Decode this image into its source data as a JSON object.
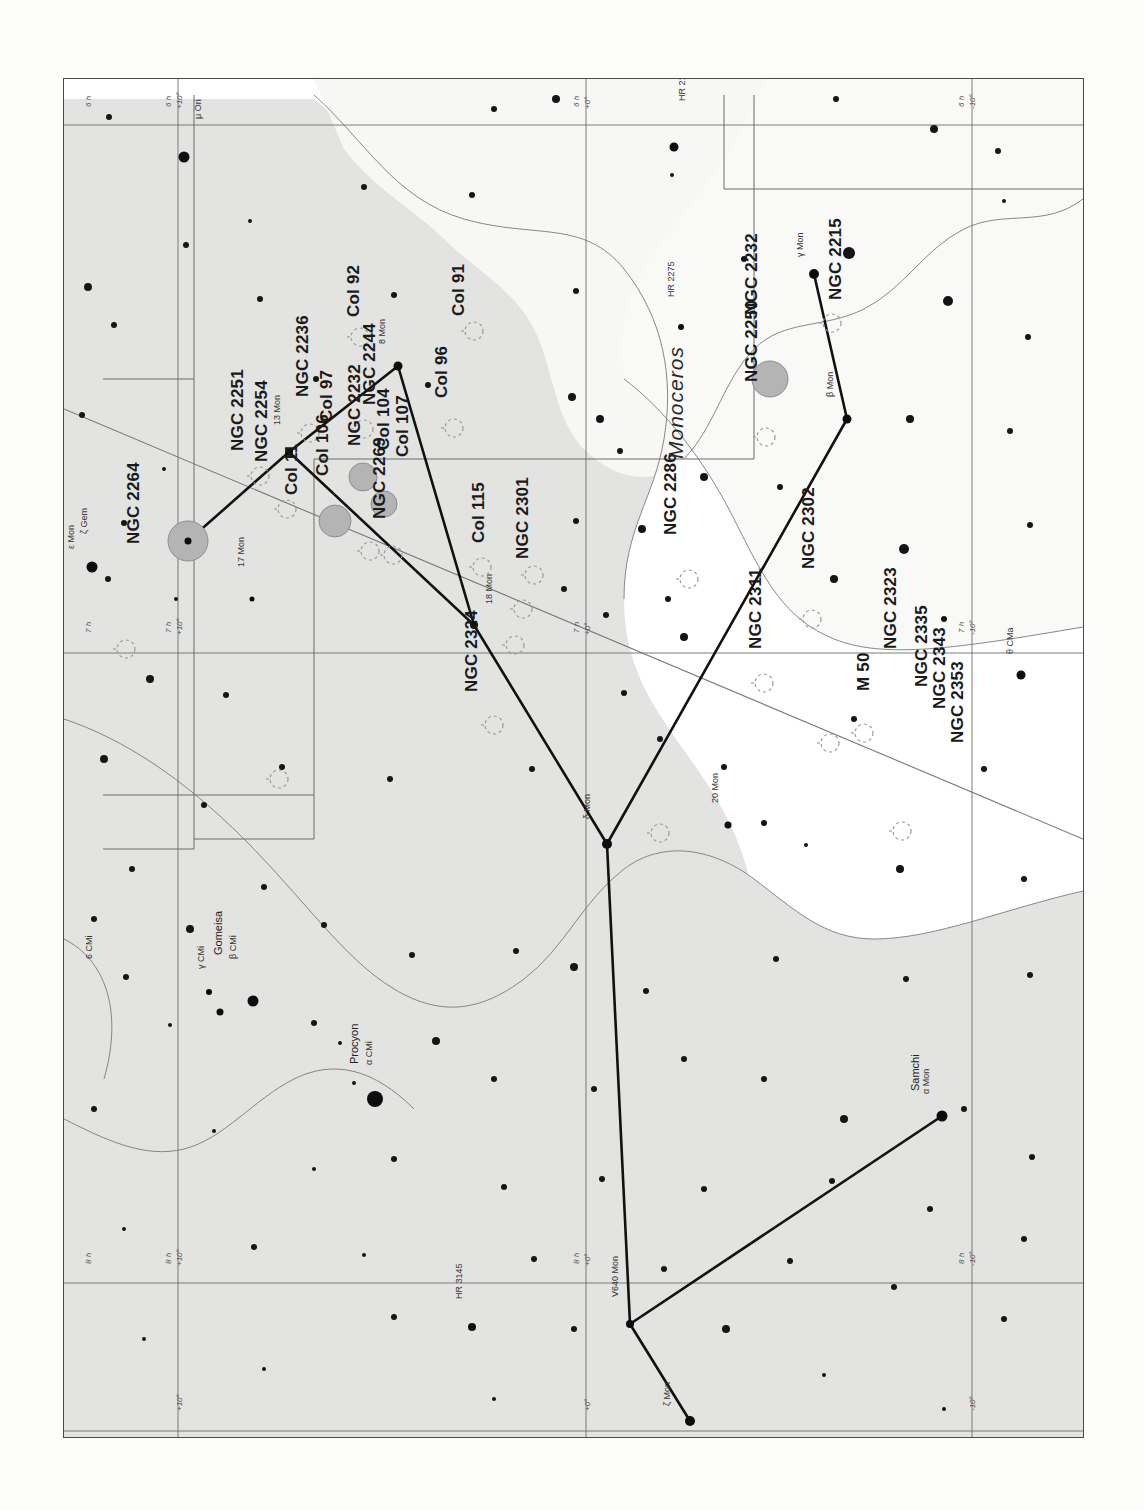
{
  "meta": {
    "chart_type": "star-chart",
    "constellation": "Monoceros",
    "orientation_note": "chart rotated 90° counter-clockwise on the page",
    "ink_color": "#1a1a1a",
    "milkyway_fill": "#e3e3e1",
    "frame_color": "#4a4a4a"
  },
  "constellation_label": "Monoceros",
  "deep_sky_objects": [
    {
      "label": "NGC 2264",
      "x": 60,
      "y": 465
    },
    {
      "label": "NGC 2251",
      "x": 164,
      "y": 372
    },
    {
      "label": "NGC 2254",
      "x": 188,
      "y": 383
    },
    {
      "label": "NGC 2236",
      "x": 229,
      "y": 318
    },
    {
      "label": "Col 11",
      "x": 218,
      "y": 416
    },
    {
      "label": "Col 106",
      "x": 249,
      "y": 397
    },
    {
      "label": "Col 97",
      "x": 253,
      "y": 343
    },
    {
      "label": "NGC 2232",
      "x": 281,
      "y": 367
    },
    {
      "label": "NGC 2244",
      "x": 296,
      "y": 326
    },
    {
      "label": "Col 104",
      "x": 310,
      "y": 371
    },
    {
      "label": "Col 107",
      "x": 329,
      "y": 378
    },
    {
      "label": "NGC 2269",
      "x": 306,
      "y": 440
    },
    {
      "label": "Col 92",
      "x": 280,
      "y": 238
    },
    {
      "label": "Col 91",
      "x": 385,
      "y": 237
    },
    {
      "label": "Col 96",
      "x": 368,
      "y": 319
    },
    {
      "label": "Col 115",
      "x": 405,
      "y": 464
    },
    {
      "label": "NGC 2301",
      "x": 449,
      "y": 480
    },
    {
      "label": "NGC 2324",
      "x": 398,
      "y": 613
    },
    {
      "label": "NGC 2215",
      "x": 762,
      "y": 221
    },
    {
      "label": "NGC 2232 ",
      "x": 678,
      "y": 236
    },
    {
      "label": "NGC 2250",
      "x": 678,
      "y": 303
    },
    {
      "label": "NGC 2286",
      "x": 597,
      "y": 456
    },
    {
      "label": "NGC 2302",
      "x": 735,
      "y": 490
    },
    {
      "label": "NGC 2311",
      "x": 682,
      "y": 570
    },
    {
      "label": "NGC 2323",
      "x": 817,
      "y": 570
    },
    {
      "label": "M 50",
      "x": 790,
      "y": 612
    },
    {
      "label": "NGC 2335",
      "x": 848,
      "y": 608
    },
    {
      "label": "NGC 2343",
      "x": 866,
      "y": 630
    },
    {
      "label": "NGC 2353",
      "x": 884,
      "y": 664
    }
  ],
  "star_labels": [
    {
      "label": "μ Ori",
      "x": 129,
      "y": 40
    },
    {
      "label": "ζ Gem",
      "x": 15,
      "y": 455
    },
    {
      "label": "6 CMi",
      "x": 20,
      "y": 880
    },
    {
      "label": "θ CMa",
      "x": 941,
      "y": 575
    },
    {
      "label": "HR 2113",
      "x": 613,
      "y": 22
    },
    {
      "label": "HR 2275",
      "x": 602,
      "y": 218
    },
    {
      "label": "HR 3145",
      "x": 390,
      "y": 1220
    },
    {
      "label": "γ Mon",
      "x": 731,
      "y": 178
    },
    {
      "label": "β Mon",
      "x": 761,
      "y": 318
    },
    {
      "label": "13 Mon",
      "x": 208,
      "y": 346
    },
    {
      "label": "8 Mon",
      "x": 313,
      "y": 265
    },
    {
      "label": "17 Mon",
      "x": 172,
      "y": 488
    },
    {
      "label": "18 Mon",
      "x": 420,
      "y": 525
    },
    {
      "label": "20 Mon",
      "x": 646,
      "y": 724
    },
    {
      "label": "δ Mon",
      "x": 518,
      "y": 740
    },
    {
      "label": "α Mon",
      "x": 857,
      "y": 1015
    },
    {
      "label": "Samchi",
      "x": 845,
      "y": 1012
    },
    {
      "label": "V640 Mon",
      "x": 546,
      "y": 1218
    },
    {
      "label": "ζ Mon",
      "x": 598,
      "y": 1327
    },
    {
      "label": "γ CMi",
      "x": 132,
      "y": 890
    },
    {
      "label": "β CMi",
      "x": 164,
      "y": 880
    },
    {
      "label": "Gomeisa",
      "x": 148,
      "y": 876
    },
    {
      "label": "Procyon",
      "x": 284,
      "y": 985
    },
    {
      "label": "α CMi",
      "x": 300,
      "y": 986
    },
    {
      "label": "ε Mon",
      "x": 2,
      "y": 470
    }
  ],
  "grid_labels": [
    {
      "ra": "6 h",
      "dec": "+10°",
      "x": 100,
      "y": 28
    },
    {
      "ra": "6 h",
      "dec": "",
      "x": 20,
      "y": 28
    },
    {
      "ra": "6 h",
      "dec": "+0°",
      "x": 508,
      "y": 28
    },
    {
      "ra": "6 h",
      "dec": "-10°",
      "x": 893,
      "y": 28
    },
    {
      "ra": "7 h",
      "dec": "",
      "x": 20,
      "y": 554
    },
    {
      "ra": "7 h",
      "dec": "+10°",
      "x": 100,
      "y": 554
    },
    {
      "ra": "7 h",
      "dec": "+0°",
      "x": 508,
      "y": 554
    },
    {
      "ra": "7 h",
      "dec": "-10°",
      "x": 893,
      "y": 554
    },
    {
      "ra": "8 h",
      "dec": "",
      "x": 20,
      "y": 1185
    },
    {
      "ra": "8 h",
      "dec": "+10°",
      "x": 100,
      "y": 1185
    },
    {
      "ra": "8 h",
      "dec": "+0°",
      "x": 508,
      "y": 1185
    },
    {
      "ra": "8 h",
      "dec": "-10°",
      "x": 893,
      "y": 1185
    },
    {
      "ra": "",
      "dec": "+10°",
      "x": 100,
      "y": 1330
    },
    {
      "ra": "",
      "dec": "+0°",
      "x": 508,
      "y": 1330
    },
    {
      "ra": "",
      "dec": "-10°",
      "x": 893,
      "y": 1330
    }
  ],
  "bleed_through_lines": [
    {
      "text": "the most prominent feature of",
      "x": 330,
      "y": 196
    },
    {
      "text": "the winter Milky Way",
      "x": 355,
      "y": 225
    },
    {
      "text": "the boundaries of the constellation found",
      "x": 640,
      "y": 200
    },
    {
      "text": "NGC 2264 and the Cone Nebula",
      "x": 300,
      "y": 440
    },
    {
      "text": "clusters as well as",
      "x": 640,
      "y": 440
    },
    {
      "text": "V 2 The nebula lies at a distance of some 2600 light years and extends",
      "x": 190,
      "y": 620
    },
    {
      "text": "to the south. Open clusters abound in the region, with the brightest",
      "x": 190,
      "y": 646
    },
    {
      "text": "being M 50. This is a rich cluster of which more than a hundred stars",
      "x": 190,
      "y": 672
    },
    {
      "text": "are brighter than magnitude 13. Also notable are NGC 2301, NGC",
      "x": 190,
      "y": 698
    },
    {
      "text": "and Christmas Tree Cluster. The Rosette Nebula is a large faint ring of",
      "x": 110,
      "y": 748
    },
    {
      "text": "nebulosity which is best seen with binoculars or a rich-field telescope",
      "x": 110,
      "y": 774
    },
    {
      "text": "in a dark sky. The cluster NGC 2244 is embedded within it.",
      "x": 110,
      "y": 800
    },
    {
      "text": "The star cluster NGC 2264 lies above the Cone Nebula, a dark column",
      "x": 110,
      "y": 826
    },
    {
      "text": "of dust silhouetted against emission nebulosity. The Cone itself is",
      "x": 110,
      "y": 852
    },
    {
      "text": "notoriously elusive and has to be imaged. Visually the region is rich",
      "x": 110,
      "y": 878
    },
    {
      "text": "and may be rewarding to search for other objects.",
      "x": 110,
      "y": 904
    },
    {
      "text": "M 50",
      "x": 200,
      "y": 1010
    },
    {
      "text": "NGC 2244",
      "x": 430,
      "y": 1010
    },
    {
      "text": "NGC 2264",
      "x": 700,
      "y": 1010
    },
    {
      "text": "6 25.5",
      "x": 210,
      "y": 1044
    },
    {
      "text": "6 32.3",
      "x": 440,
      "y": 1044
    },
    {
      "text": "6 41.1",
      "x": 712,
      "y": 1044
    },
    {
      "text": "The observations were made with a 10-inch",
      "x": 195,
      "y": 1155
    },
    {
      "text": "reflector under moderately dark skies.",
      "x": 205,
      "y": 1195
    },
    {
      "text": "NGC 2353",
      "x": 210,
      "y": 1292
    },
    {
      "text": "NGC 2343",
      "x": 470,
      "y": 1292
    },
    {
      "text": "NGC 2335",
      "x": 728,
      "y": 1292
    }
  ],
  "chart_data": {
    "type": "scatter",
    "xlabel": "Right Ascension (6h – 8h)",
    "ylabel": "Declination (+10° – -10°)",
    "grid": true,
    "legend": "none",
    "ra_ticks": [
      "6 h",
      "7 h",
      "8 h"
    ],
    "dec_ticks": [
      "+10°",
      "+0°",
      "-10°"
    ],
    "bright_stars": [
      {
        "name": "μ Ori",
        "x": 120,
        "y": 78,
        "mag_r": 11
      },
      {
        "name": "HR 2113",
        "x": 610,
        "y": 68,
        "mag_r": 9
      },
      {
        "name": "γ Mon",
        "x": 750,
        "y": 195,
        "mag_r": 10
      },
      {
        "name": "HR 2275",
        "x": 617,
        "y": 248,
        "mag_r": 6
      },
      {
        "name": "8 Mon",
        "x": 334,
        "y": 287,
        "mag_r": 9
      },
      {
        "name": "β Mon",
        "x": 783,
        "y": 340,
        "mag_r": 9
      },
      {
        "name": "13 Mon",
        "x": 225,
        "y": 373,
        "mag_r": 8
      },
      {
        "name": "NGC2264*",
        "x": 124,
        "y": 462,
        "mag_r": 7
      },
      {
        "name": "ζ Gem",
        "x": 28,
        "y": 488,
        "mag_r": 11
      },
      {
        "name": "17 Mon",
        "x": 188,
        "y": 520,
        "mag_r": 5
      },
      {
        "name": "18 Mon",
        "x": 410,
        "y": 546,
        "mag_r": 8
      },
      {
        "name": "θ CMa",
        "x": 957,
        "y": 596,
        "mag_r": 9
      },
      {
        "name": "20 Mon",
        "x": 664,
        "y": 746,
        "mag_r": 7
      },
      {
        "name": "δ Mon",
        "x": 543,
        "y": 765,
        "mag_r": 10
      },
      {
        "name": "γ CMi",
        "x": 145,
        "y": 913,
        "mag_r": 6
      },
      {
        "name": "γ CMi b",
        "x": 156,
        "y": 933,
        "mag_r": 7
      },
      {
        "name": "β CMi",
        "x": 189,
        "y": 922,
        "mag_r": 11
      },
      {
        "name": "Procyon",
        "x": 311,
        "y": 1020,
        "mag_r": 16
      },
      {
        "name": "α Mon",
        "x": 878,
        "y": 1037,
        "mag_r": 11
      },
      {
        "name": "V640 Mon",
        "x": 566,
        "y": 1245,
        "mag_r": 8
      },
      {
        "name": "HR 3145",
        "x": 408,
        "y": 1248,
        "mag_r": 8
      },
      {
        "name": "ζ Mon",
        "x": 626,
        "y": 1342,
        "mag_r": 10
      }
    ]
  }
}
